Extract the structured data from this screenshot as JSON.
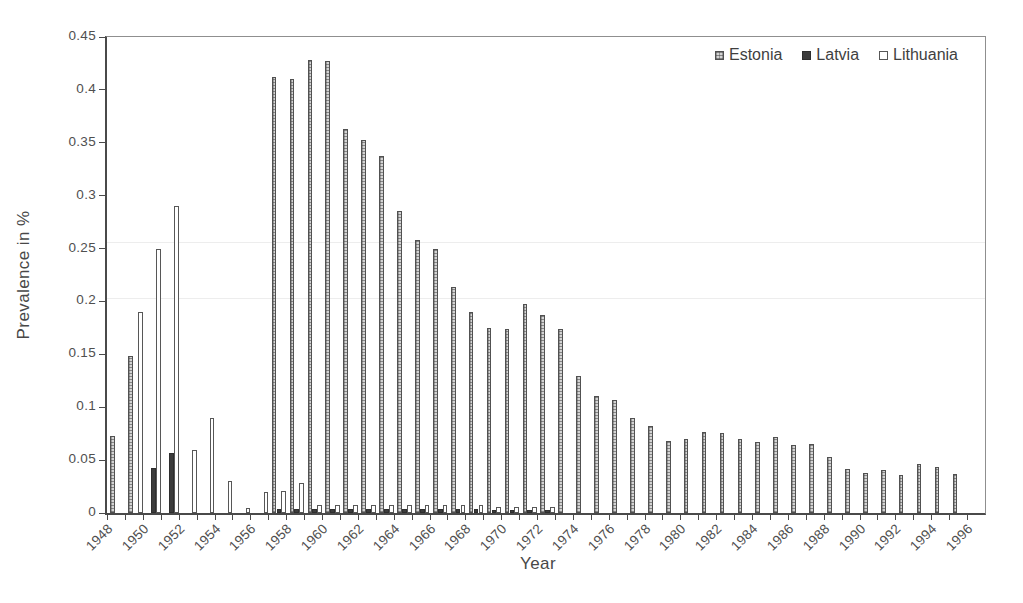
{
  "chart_data": {
    "type": "bar",
    "title": "",
    "xlabel": "Year",
    "ylabel": "Prevalence in %",
    "ylim": [
      0,
      0.45
    ],
    "ytick_step": 0.05,
    "ytick_labels": [
      "0",
      "0.05",
      "0.1",
      "0.15",
      "0.2",
      "0.25",
      "0.3",
      "0.35",
      "0.4",
      "0.45"
    ],
    "xtick_labels": [
      "1948",
      "1950",
      "1952",
      "1954",
      "1956",
      "1958",
      "1960",
      "1962",
      "1964",
      "1966",
      "1968",
      "1970",
      "1972",
      "1974",
      "1976",
      "1978",
      "1980",
      "1982",
      "1984",
      "1986",
      "1988",
      "1990",
      "1992",
      "1994",
      "1996"
    ],
    "grid": false,
    "legend_position": "top-right",
    "categories": [
      1948,
      1949,
      1950,
      1951,
      1952,
      1953,
      1954,
      1955,
      1956,
      1957,
      1958,
      1959,
      1960,
      1961,
      1962,
      1963,
      1964,
      1965,
      1966,
      1967,
      1968,
      1969,
      1970,
      1971,
      1972,
      1973,
      1974,
      1975,
      1976,
      1977,
      1978,
      1979,
      1980,
      1981,
      1982,
      1983,
      1984,
      1985,
      1986,
      1987,
      1988,
      1989,
      1990,
      1991,
      1992,
      1993,
      1994,
      1995,
      1996
    ],
    "series": [
      {
        "name": "Estonia",
        "style": "hatched-gray",
        "values": [
          0.073,
          0.148,
          0,
          0,
          0,
          0,
          0,
          0,
          0,
          0.412,
          0.41,
          0.428,
          0.427,
          0.363,
          0.353,
          0.338,
          0.286,
          0.258,
          0.25,
          0.214,
          0.19,
          0.175,
          0.174,
          0.198,
          0.187,
          0.174,
          0.13,
          0.111,
          0.107,
          0.09,
          0.082,
          0.068,
          0.07,
          0.077,
          0.076,
          0.07,
          0.067,
          0.072,
          0.064,
          0.065,
          0.053,
          0.042,
          0.038,
          0.041,
          0.036,
          0.046,
          0.044,
          0.037,
          0
        ]
      },
      {
        "name": "Latvia",
        "style": "solid-dark",
        "values": [
          0,
          0,
          0.043,
          0.057,
          0,
          0,
          0,
          0,
          0,
          0.004,
          0.004,
          0.004,
          0.004,
          0.004,
          0.004,
          0.004,
          0.004,
          0.004,
          0.004,
          0.004,
          0.004,
          0.003,
          0.003,
          0.003,
          0.003,
          0,
          0,
          0,
          0,
          0,
          0,
          0,
          0,
          0,
          0,
          0,
          0,
          0,
          0,
          0,
          0,
          0,
          0,
          0,
          0,
          0,
          0,
          0,
          0
        ]
      },
      {
        "name": "Lithuania",
        "style": "white-outline",
        "values": [
          0,
          0.19,
          0.25,
          0.29,
          0.06,
          0.09,
          0.03,
          0.005,
          0.02,
          0.021,
          0.028,
          0.008,
          0.008,
          0.008,
          0.008,
          0.008,
          0.008,
          0.008,
          0.008,
          0.008,
          0.008,
          0.006,
          0.006,
          0.006,
          0.006,
          0,
          0,
          0,
          0,
          0,
          0,
          0,
          0,
          0,
          0,
          0,
          0,
          0,
          0,
          0,
          0,
          0,
          0,
          0,
          0,
          0,
          0,
          0,
          0
        ]
      }
    ]
  },
  "colors": {
    "estonia_fill": "#d4d4d4",
    "estonia_hatch": "#464646",
    "latvia_fill": "#3c3c3c",
    "lithuania_fill": "#ffffff",
    "bar_outline": "#515151",
    "axis": "#4a4a4a",
    "text": "#4f4f4f",
    "background": "#ffffff"
  }
}
